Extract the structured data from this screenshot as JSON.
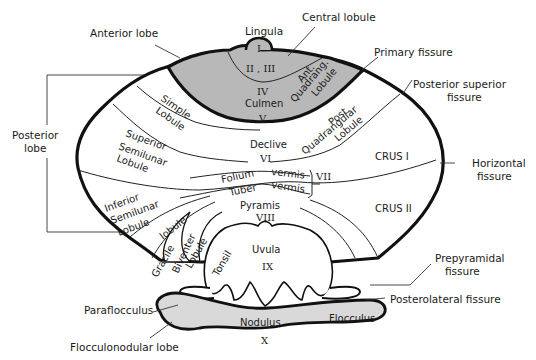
{
  "figure": {
    "colors": {
      "anterior_lobe_fill": "#b8b8b8",
      "flocculonodular_fill": "#d9d9d9",
      "outline": "#111111",
      "background": "#ffffff"
    }
  },
  "external_labels": {
    "anterior_lobe": "Anterior   lobe",
    "lingula": "Lingula",
    "central_lobule": "Central  lobule",
    "primary_fissure": "Primary  fissure",
    "posterior_superior_fissure_1": "Posterior  superior",
    "posterior_superior_fissure_2": "fissure",
    "posterior_lobe_1": "Posterior",
    "posterior_lobe_2": "lobe",
    "horizontal_fissure_1": "Horizontal",
    "horizontal_fissure_2": "fissure",
    "prepyramidal_fissure_1": "Prepyramidal",
    "prepyramidal_fissure_2": "fissure",
    "posterolateral_fissure": "Posterolateral   fissure",
    "paraflocculus": "Paraflocculus",
    "flocculonodular_lobe": "Flocculonodular   lobe"
  },
  "regions": {
    "lingula_num": "I",
    "central_num": "II , III",
    "ant_quadrang_1": "Ant.",
    "ant_quadrang_2": "Quadrang.",
    "ant_quadrang_3": "Lobule",
    "culmen_num_top": "IV",
    "culmen": "Culmen",
    "culmen_num_bottom": "V",
    "simple_1": "Simple",
    "simple_2": "Lobule",
    "post_quadrang_1": "Post.",
    "post_quadrang_2": "Quadrangular",
    "post_quadrang_3": "Lobule",
    "superior_semilunar_1": "Superior",
    "superior_semilunar_2": "Semilunar",
    "superior_semilunar_3": "Lobule",
    "declive": "Declive",
    "declive_num": "VI",
    "crus_1": "CRUS  I",
    "folium": "Folium",
    "folium_vermis": "vermis",
    "tuber": "Tuber",
    "tuber_vermis": "vermis",
    "vii_num": "VII",
    "inferior_semilunar_1": "Inferior",
    "inferior_semilunar_2": "Semilunar",
    "inferior_semilunar_3": "Lobule",
    "crus_2": "CRUS  II",
    "pyramis": "Pyramis",
    "pyramis_num": "VIII",
    "gracile": "Gracile",
    "gracile_lobule": "lobule",
    "biventer_1": "Biventer",
    "biventer_2": "Lobule",
    "tonsil": "Tonsil",
    "uvula": "Uvula",
    "uvula_num": "IX",
    "nodulus": "Nodulus",
    "nodulus_num": "X",
    "flocculus": "Flocculus"
  }
}
